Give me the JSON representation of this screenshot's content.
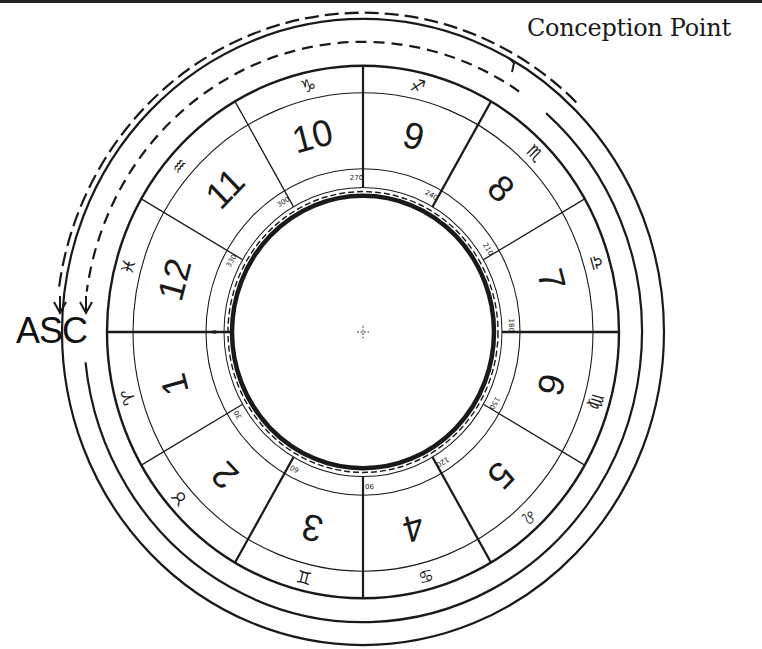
{
  "diagram": {
    "type": "astrological-natal-wheel",
    "labels": {
      "conception_point": "Conception Point",
      "ascendant": "ASC"
    },
    "houses": [
      {
        "number": "1",
        "start_deg": 0,
        "sign": "aries",
        "sign_glyph": "♈",
        "sign_deg": 15
      },
      {
        "number": "2",
        "start_deg": 30,
        "sign": "taurus",
        "sign_glyph": "♉",
        "sign_deg": 41
      },
      {
        "number": "3",
        "start_deg": 60,
        "sign": "gemini",
        "sign_glyph": "♊",
        "sign_deg": 76
      },
      {
        "number": "4",
        "start_deg": 90,
        "sign": "cancer",
        "sign_glyph": "♋",
        "sign_deg": 105
      },
      {
        "number": "5",
        "start_deg": 120,
        "sign": "leo",
        "sign_glyph": "♌",
        "sign_deg": 133
      },
      {
        "number": "6",
        "start_deg": 150,
        "sign": "virgo",
        "sign_glyph": "♍",
        "sign_deg": 164
      },
      {
        "number": "7",
        "start_deg": 180,
        "sign": "libra",
        "sign_glyph": "♎",
        "sign_deg": 196
      },
      {
        "number": "8",
        "start_deg": 210,
        "sign": "scorpio",
        "sign_glyph": "♏",
        "sign_deg": 225
      },
      {
        "number": "9",
        "start_deg": 240,
        "sign": "sagittarius",
        "sign_glyph": "♐",
        "sign_deg": 257
      },
      {
        "number": "10",
        "start_deg": 270,
        "sign": "capricorn",
        "sign_glyph": "♑",
        "sign_deg": 283
      },
      {
        "number": "11",
        "start_deg": 300,
        "sign": "aquarius",
        "sign_glyph": "♒",
        "sign_deg": 319
      },
      {
        "number": "12",
        "start_deg": 330,
        "sign": "pisces",
        "sign_glyph": "♓",
        "sign_deg": 345
      }
    ],
    "degree_labels": [
      "0",
      "30",
      "60",
      "90",
      "120",
      "150",
      "180",
      "210",
      "240",
      "270",
      "300",
      "330"
    ],
    "center_marker": "+",
    "colors": {
      "ink": "#1a1a1a",
      "paper": "#ffffff"
    }
  }
}
